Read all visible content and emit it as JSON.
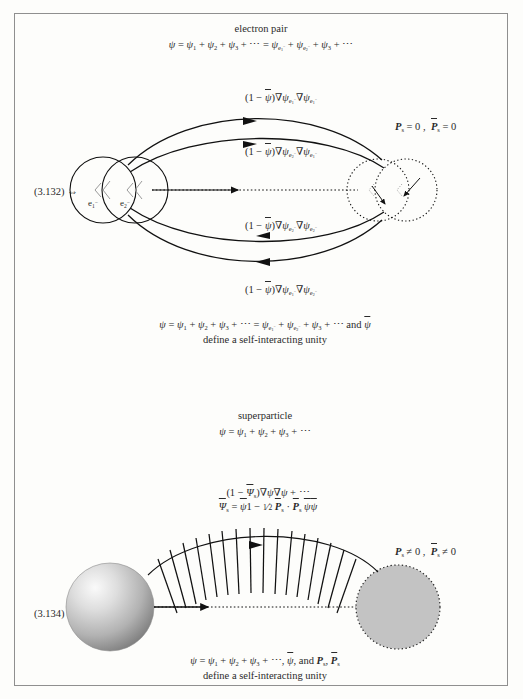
{
  "page": {
    "background": "#fdfdfb",
    "frame_color": "#8f8f8f"
  },
  "top_panel": {
    "title": "electron pair",
    "equation": "ψ = ψ₁ + ψ₂ + ψ₃ + ⋯ = ψₑ₁⁻ + ψₑ₂⁻ + ψ₃ + ⋯",
    "eq_number": "(3.132) ⇔",
    "left_node_labels": [
      "e₁⁻",
      "e₂⁻"
    ],
    "right_condition": "𝑷s = 0 ,  𝑷̄s = 0",
    "arc_labels": [
      "(1 − ψ̄)∇ψₑ₁⁻∇ψₑ₁⁻",
      "(1 − ψ̄)∇ψₑ₂⁻∇ψₑ₁⁻",
      "(1 − ψ̄)∇ψₑ₂⁻∇ψₑ₂⁻",
      "(1 − ψ̄)∇ψₑ₁⁻∇ψₑ₂⁻"
    ],
    "caption_line1": "ψ = ψ₁ + ψ₂ + ψ₃ + ⋯ = ψₑ₁⁻ + ψₑ₂⁻ + ψ₃ + ⋯ and ψ̄",
    "caption_line2": "define a self-interacting unity"
  },
  "bottom_panel": {
    "title": "superparticle",
    "equation": "ψ = ψ₁ + ψ₂ + ψ₃ + ⋯",
    "eq_number": "(3.134) ⇔",
    "field_line1": "(1 − Ψ̄s)∇ψ∇ψ + ⋯",
    "field_line2": "Ψ̄s = ψ̄1 − ½ 𝑷̄s · 𝑷̄s ψ̄ψ̄",
    "right_condition": "𝑷s ≠ 0 ,  𝑷̄s ≠ 0",
    "caption_line1": "ψ = ψ₁ + ψ₂ + ψ₃ + ⋯, ψ̄, and 𝑷s, 𝑷̄s",
    "caption_line2": "define a self-interacting unity",
    "sphere_left_fill": "#b9b9b9",
    "sphere_right_fill": "#c3c3c3"
  }
}
